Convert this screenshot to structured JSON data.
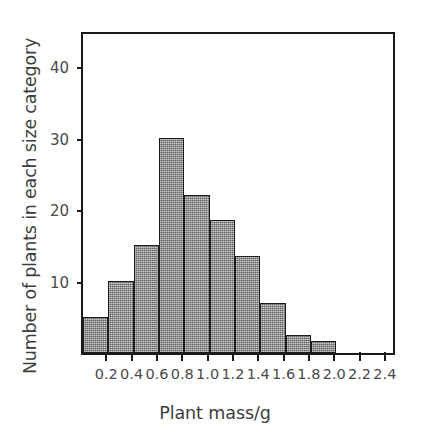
{
  "chart_data": {
    "type": "bar",
    "title": "",
    "subtitle": "",
    "xlabel": "Plant mass/g",
    "ylabel": "Number of plants in each size category",
    "bin_width": 0.2,
    "bin_edges": [
      0.0,
      0.2,
      0.4,
      0.6,
      0.8,
      1.0,
      1.2,
      1.4,
      1.6,
      1.8,
      2.0,
      2.2,
      2.4
    ],
    "categories": [
      "0.0-0.2",
      "0.2-0.4",
      "0.4-0.6",
      "0.6-0.8",
      "0.8-1.0",
      "1.0-1.2",
      "1.2-1.4",
      "1.4-1.6",
      "1.6-1.8",
      "1.8-2.0",
      "2.0-2.2",
      "2.2-2.4"
    ],
    "values": [
      5,
      10,
      15,
      30,
      22,
      18.5,
      13.5,
      7,
      2.5,
      1.7,
      0,
      0
    ],
    "xlim": [
      0.0,
      2.48
    ],
    "ylim": [
      0,
      45
    ],
    "xticks": [
      0.2,
      0.4,
      0.6,
      0.8,
      1.0,
      1.2,
      1.4,
      1.6,
      1.8,
      2.0,
      2.2,
      2.4
    ],
    "xtick_labels": [
      "0.2",
      "0.4",
      "0.6",
      "0.8",
      "1.0",
      "1.2",
      "1.4",
      "1.6",
      "1.8",
      "2.0",
      "2.2",
      "2.4"
    ],
    "yticks": [
      10,
      20,
      30,
      40
    ],
    "ytick_labels": [
      "10",
      "20",
      "30",
      "40"
    ],
    "grid": false,
    "legend": null,
    "colors": {
      "bar_fill": "#8d8d8d",
      "bar_edge": "#1c1c1c",
      "frame": "#1a1a1a",
      "text": "#4a4a4a",
      "background": "#ffffff"
    }
  }
}
